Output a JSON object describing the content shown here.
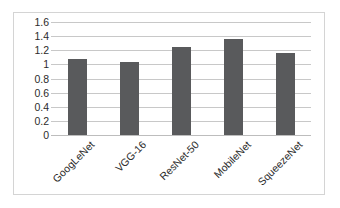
{
  "chart_data": {
    "type": "bar",
    "title": "",
    "xlabel": "",
    "ylabel": "",
    "categories": [
      "GoogLeNet",
      "VGG-16",
      "ResNet-50",
      "MobileNet",
      "SqueezeNet"
    ],
    "values": [
      1.07,
      1.04,
      1.24,
      1.36,
      1.16
    ],
    "ylim": [
      0,
      1.6
    ],
    "yticks": [
      "0",
      "0.2",
      "0.4",
      "0.6",
      "0.8",
      "1",
      "1.2",
      "1.4",
      "1.6"
    ],
    "ytick_values": [
      0,
      0.2,
      0.4,
      0.6,
      0.8,
      1,
      1.2,
      1.4,
      1.6
    ],
    "grid": true,
    "legend": false,
    "legend_position": "none",
    "series": [
      {
        "name": "",
        "values": [
          1.07,
          1.04,
          1.24,
          1.36,
          1.16
        ]
      }
    ],
    "colors": {
      "bar": "#595a5c",
      "gridline": "#c8c8c8",
      "border": "#d4d4d4",
      "background": "#ffffff",
      "text": "#2b2b2b"
    }
  }
}
